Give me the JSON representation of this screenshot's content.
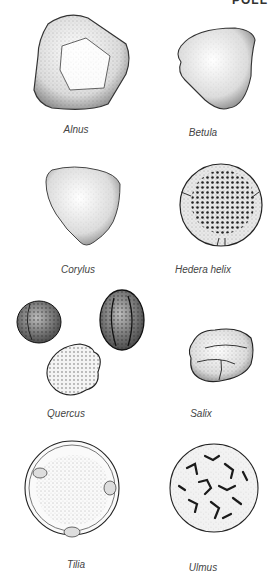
{
  "page": {
    "header_fragment": "POLL",
    "specimens": [
      {
        "name": "Alnus"
      },
      {
        "name": "Betula"
      },
      {
        "name": "Corylus"
      },
      {
        "name": "Hedera helix"
      },
      {
        "name": "Quercus"
      },
      {
        "name": "Salix"
      },
      {
        "name": "Tilia"
      },
      {
        "name": "Ulmus"
      }
    ]
  }
}
